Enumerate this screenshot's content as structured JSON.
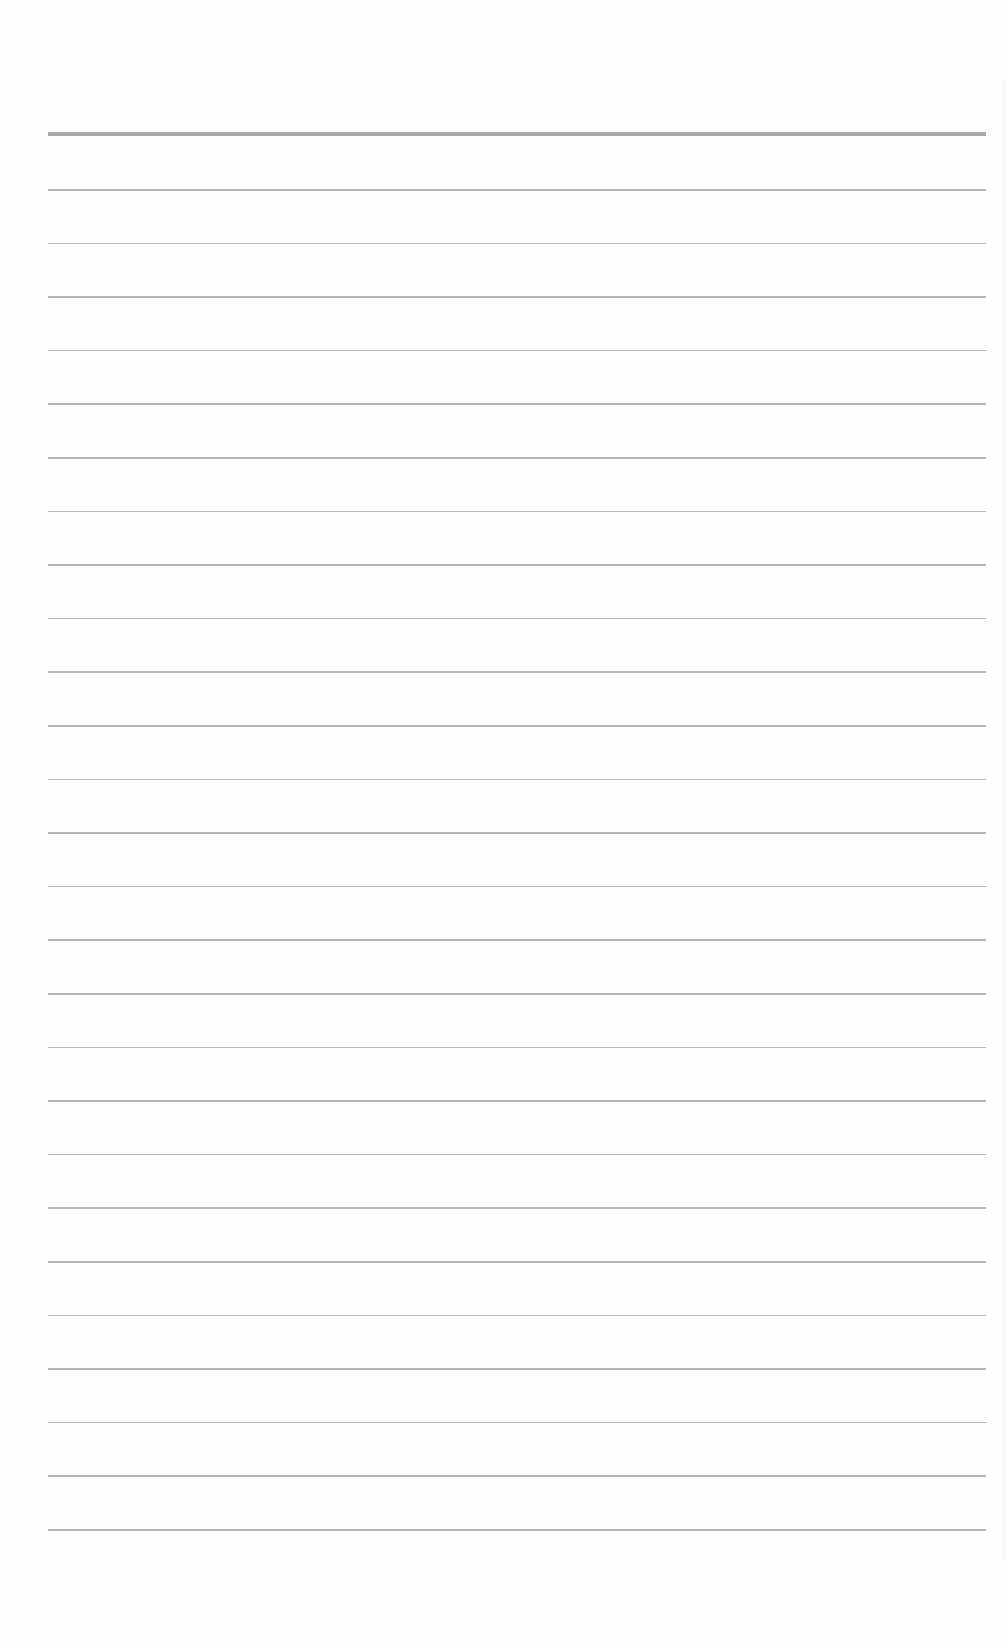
{
  "document": {
    "type": "lined-paper",
    "background_color": "#fefefe",
    "line_color": "#b4b4b4",
    "header_rule_color": "#a8a8a8",
    "header_rule_top": 132,
    "first_line_top": 189,
    "line_spacing": 53.6,
    "line_count": 26,
    "text": ""
  }
}
